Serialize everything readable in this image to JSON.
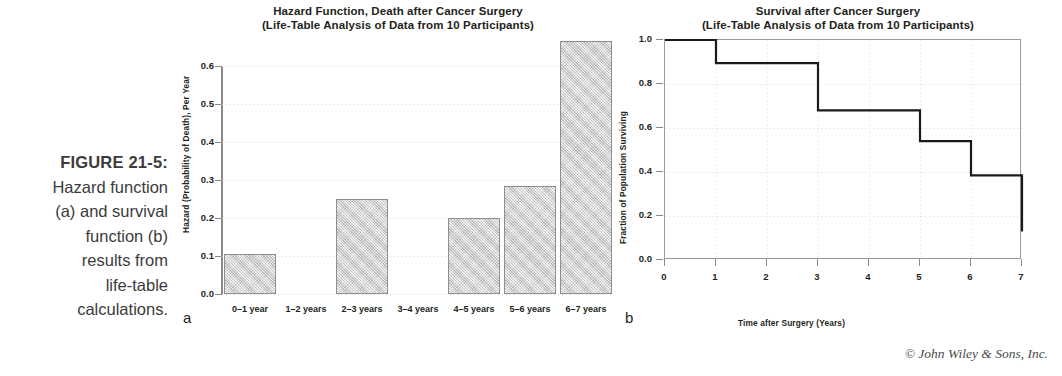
{
  "caption": {
    "figure_number": "FIGURE 21-5:",
    "lines": [
      "Hazard function",
      "(a) and survival",
      "function (b)",
      "results from",
      "life-table",
      "calculations."
    ]
  },
  "credit": "© John Wiley & Sons, Inc.",
  "panels": {
    "a": "a",
    "b": "b"
  },
  "chart_data": [
    {
      "type": "bar",
      "panel": "a",
      "title": "Hazard Function, Death after Cancer Surgery",
      "subtitle": "(Life-Table Analysis of Data from 10 Participants)",
      "xlabel": "",
      "ylabel": "Hazard (Probability of Death), Per Year",
      "categories": [
        "0–1 year",
        "1–2 years",
        "2–3 years",
        "3–4 years",
        "4–5 years",
        "5–6 years",
        "6–7 years"
      ],
      "values": [
        0.105,
        0.0,
        0.25,
        0.0,
        0.2,
        0.285,
        0.665
      ],
      "yticks": [
        "0.0",
        "0.1",
        "0.2",
        "0.3",
        "0.4",
        "0.5",
        "0.6"
      ],
      "ytick_values": [
        0.0,
        0.1,
        0.2,
        0.3,
        0.4,
        0.5,
        0.6
      ],
      "ylim": [
        0.0,
        0.6
      ],
      "grid": "horizontal-dotted",
      "legend": "none",
      "bar_fill": "#d6d6d6",
      "bar_edge": "#8e8e8e"
    },
    {
      "type": "line",
      "panel": "b",
      "title": "Survival after Cancer Surgery",
      "subtitle": "(Life-Table Analysis of Data from 10 Participants)",
      "xlabel": "Time after Surgery (Years)",
      "ylabel": "Fraction of Population Surviving",
      "xticks": [
        "0",
        "1",
        "2",
        "3",
        "4",
        "5",
        "6",
        "7"
      ],
      "xtick_values": [
        0,
        1,
        2,
        3,
        4,
        5,
        6,
        7
      ],
      "yticks": [
        "0.0",
        "0.2",
        "0.4",
        "0.6",
        "0.8",
        "1.0"
      ],
      "ytick_values": [
        0.0,
        0.2,
        0.4,
        0.6,
        0.8,
        1.0
      ],
      "xlim": [
        0,
        7
      ],
      "ylim": [
        0.0,
        1.0
      ],
      "grid": "both-dotted",
      "legend": "none",
      "line_color": "#1a1a1a",
      "step_x": [
        0,
        1,
        1,
        3,
        3,
        5,
        5,
        6,
        6,
        7,
        7
      ],
      "step_y": [
        1.0,
        1.0,
        0.895,
        0.895,
        0.68,
        0.68,
        0.54,
        0.54,
        0.385,
        0.385,
        0.13
      ],
      "points": [
        {
          "x": 0,
          "y": 1.0
        },
        {
          "x": 1,
          "y": 0.895
        },
        {
          "x": 3,
          "y": 0.68
        },
        {
          "x": 5,
          "y": 0.54
        },
        {
          "x": 6,
          "y": 0.385
        },
        {
          "x": 7,
          "y": 0.13
        }
      ]
    }
  ]
}
